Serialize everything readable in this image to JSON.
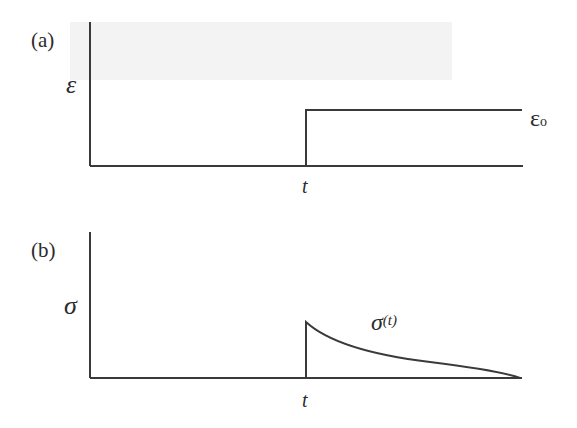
{
  "figure": {
    "panels": [
      {
        "id": "a",
        "label": "(a)",
        "y_axis_symbol": "ε",
        "x_tick_label": "t",
        "curve_label_main": "ε",
        "curve_label_sub": "o",
        "description": "Step strain applied at time t, held constant at ε0"
      },
      {
        "id": "b",
        "label": "(b)",
        "y_axis_symbol": "σ",
        "x_tick_label": "t",
        "curve_label_main": "σ",
        "curve_label_arg": "(t)",
        "description": "Stress jumps at t then relaxes (decays) toward zero"
      }
    ],
    "colors": {
      "line": "#3a3a3a",
      "background": "#ffffff",
      "band": "#f3f3f3"
    }
  }
}
